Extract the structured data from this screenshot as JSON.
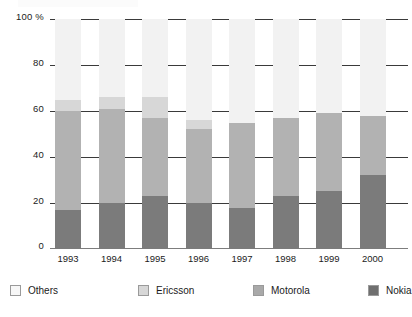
{
  "chart_data": {
    "type": "bar",
    "stacked": true,
    "title": "",
    "xlabel": "",
    "ylabel": "100 %",
    "ylim": [
      0,
      100
    ],
    "yticks": [
      "100 %",
      "80",
      "60",
      "40",
      "20",
      "0"
    ],
    "ytick_values": [
      100,
      80,
      60,
      40,
      20,
      0
    ],
    "grid": true,
    "legend_position": "bottom",
    "categories": [
      "1993",
      "1994",
      "1995",
      "1996",
      "1997",
      "1998",
      "1999",
      "2000"
    ],
    "series": [
      {
        "name": "Nokia",
        "color": "#7b7b7b",
        "values": [
          17,
          20,
          23,
          20,
          18,
          23,
          25,
          32
        ]
      },
      {
        "name": "Motorola",
        "color": "#b2b2b2",
        "values": [
          43,
          41,
          34,
          32,
          37,
          34,
          34,
          26
        ]
      },
      {
        "name": "Ericsson",
        "color": "#d7d7d7",
        "values": [
          5,
          5,
          9,
          4,
          0,
          0,
          0,
          0
        ]
      },
      {
        "name": "Others",
        "color": "#f2f2f2",
        "values": [
          35,
          34,
          34,
          44,
          45,
          43,
          41,
          42
        ]
      }
    ],
    "stack_order_bottom_to_top": [
      "Nokia",
      "Motorola",
      "Ericsson",
      "Others"
    ]
  },
  "axis": {
    "y_top_label": "100 %",
    "tick_80": "80",
    "tick_60": "60",
    "tick_40": "40",
    "tick_20": "20",
    "tick_0": "0"
  },
  "legend": {
    "items": [
      {
        "label": "Others",
        "swatch": "others-swatch"
      },
      {
        "label": "Ericsson",
        "swatch": "ericsson-swatch"
      },
      {
        "label": "Motorola",
        "swatch": "motorola-swatch"
      },
      {
        "label": "Nokia",
        "swatch": "nokia-swatch"
      }
    ]
  }
}
